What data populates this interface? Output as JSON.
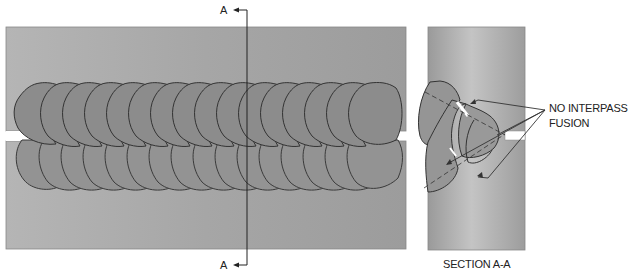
{
  "figure": {
    "section_marker_top": "A",
    "section_marker_bottom": "A",
    "callout_line1": "NO INTERPASS",
    "callout_line2": "FUSION",
    "section_caption": "SECTION A-A"
  },
  "colors": {
    "plate": "#a8a8a8",
    "plate_dark": "#9a9a9a",
    "bead": "#8f8f8f",
    "bead_outline": "#333333",
    "gap": "#ffffff",
    "line": "#222222"
  },
  "plan_view": {
    "upper_bead_row_count": 16,
    "lower_bead_row_count": 16
  }
}
